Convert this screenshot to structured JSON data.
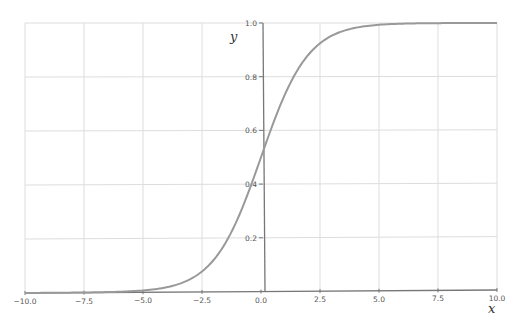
{
  "chart_data": {
    "type": "line",
    "title": "",
    "xlabel": "x",
    "ylabel": "y",
    "xlim": [
      -10,
      10
    ],
    "ylim": [
      0,
      1
    ],
    "grid": true,
    "legend": null,
    "x_ticks": [
      -10.0,
      -7.5,
      -5.0,
      -2.5,
      0.0,
      2.5,
      5.0,
      7.5,
      10.0
    ],
    "x_tick_labels": [
      "−10.0",
      "−7.5",
      "−5.0",
      "−2.5",
      "0.0",
      "2.5",
      "5.0",
      "7.5",
      "10.0"
    ],
    "y_ticks": [
      0.2,
      0.4,
      0.6,
      0.8,
      1.0
    ],
    "y_tick_labels": [
      "0.2",
      "0.4",
      "0.6",
      "0.8",
      "1.0"
    ],
    "series": [
      {
        "name": "sigmoid",
        "function": "1/(1+exp(-x))",
        "color": "#999999",
        "x": [
          -10,
          -7.5,
          -5,
          -2.5,
          -1,
          0,
          1,
          2.5,
          5,
          7.5,
          10
        ],
        "y": [
          5e-05,
          0.0006,
          0.0067,
          0.0759,
          0.2689,
          0.5,
          0.7311,
          0.9241,
          0.9933,
          0.9994,
          0.99995
        ]
      }
    ]
  },
  "colors": {
    "grid": "#dddddd",
    "axis": "#777777",
    "curve": "#999999",
    "text": "#555555"
  }
}
